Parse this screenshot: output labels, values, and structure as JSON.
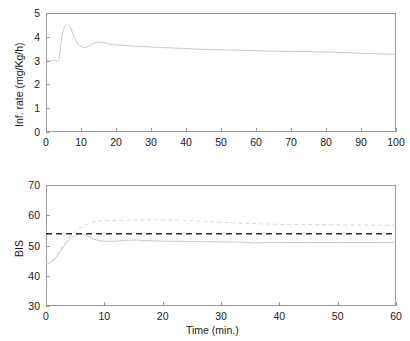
{
  "figure": {
    "background": "#ffffff",
    "axis_color": "#9a9a9a",
    "text_color": "#1a1a1a"
  },
  "chart_data": [
    {
      "type": "line",
      "panel": "top",
      "title": "",
      "xlabel": "",
      "ylabel": "Inf. rate (mg/Kg/h)",
      "xlim": [
        0,
        100
      ],
      "ylim": [
        0,
        5
      ],
      "xticks": [
        0,
        10,
        20,
        30,
        40,
        50,
        60,
        70,
        80,
        90,
        100
      ],
      "yticks": [
        0,
        1,
        2,
        3,
        4,
        5
      ],
      "grid": false,
      "legend": "none",
      "series": [
        {
          "name": "infusion-rate",
          "style": "solid",
          "color": "#c9c9c9",
          "x": [
            0,
            1,
            2,
            3,
            3.6,
            3.9,
            4.2,
            4.6,
            5.0,
            5.4,
            5.8,
            6.2,
            6.6,
            7.0,
            7.4,
            7.8,
            8.2,
            8.6,
            9.0,
            9.5,
            10.0,
            10.5,
            11.0,
            11.5,
            12.0,
            12.5,
            13.0,
            13.5,
            14.0,
            14.5,
            15.0,
            15.5,
            16.0,
            17.0,
            18.0,
            19.0,
            20.0,
            22.0,
            24.0,
            26.0,
            28.0,
            30.0,
            33.0,
            36.0,
            39.0,
            42.0,
            45.0,
            48.0,
            51.0,
            54.0,
            57.0,
            60.0,
            64.0,
            68.0,
            72.0,
            76.0,
            80.0,
            84.0,
            88.0,
            92.0,
            96.0,
            98.0,
            100.0
          ],
          "y": [
            3.0,
            3.0,
            3.0,
            3.0,
            3.0,
            3.25,
            3.62,
            4.02,
            4.28,
            4.42,
            4.49,
            4.5,
            4.47,
            4.38,
            4.24,
            4.08,
            3.94,
            3.82,
            3.72,
            3.64,
            3.59,
            3.56,
            3.55,
            3.56,
            3.59,
            3.63,
            3.68,
            3.72,
            3.75,
            3.77,
            3.78,
            3.77,
            3.76,
            3.73,
            3.7,
            3.68,
            3.66,
            3.64,
            3.62,
            3.6,
            3.59,
            3.57,
            3.55,
            3.53,
            3.51,
            3.49,
            3.47,
            3.46,
            3.45,
            3.44,
            3.43,
            3.42,
            3.4,
            3.39,
            3.38,
            3.37,
            3.36,
            3.34,
            3.32,
            3.3,
            3.28,
            3.27,
            3.26
          ]
        }
      ]
    },
    {
      "type": "line",
      "panel": "bottom",
      "title": "",
      "xlabel": "Time (min.)",
      "ylabel": "BIS",
      "xlim": [
        0,
        60
      ],
      "ylim": [
        30,
        70
      ],
      "xticks": [
        0,
        10,
        20,
        30,
        40,
        50,
        60
      ],
      "yticks": [
        30,
        40,
        50,
        60,
        70
      ],
      "grid": false,
      "legend": "none",
      "series": [
        {
          "name": "bis-measured",
          "style": "solid",
          "color": "#c9c9c9",
          "x": [
            0,
            0.5,
            1.0,
            1.5,
            2.0,
            2.5,
            3.0,
            3.5,
            4.0,
            4.5,
            5.0,
            5.5,
            6.0,
            6.5,
            7.0,
            7.5,
            8.0,
            8.5,
            9.0,
            9.5,
            10.0,
            11.0,
            12.0,
            13.0,
            14.0,
            15.0,
            16.0,
            17.0,
            18.0,
            19.0,
            20.0,
            22.0,
            24.0,
            26.0,
            28.0,
            30.0,
            32.0,
            34.0,
            35.5,
            37.0,
            39.0,
            42.0,
            45.0,
            48.0,
            51.0,
            54.0,
            57.0,
            60.0
          ],
          "y": [
            44.0,
            44.1,
            44.6,
            45.5,
            46.8,
            48.2,
            49.6,
            50.9,
            52.0,
            52.9,
            53.5,
            53.8,
            53.9,
            53.7,
            53.3,
            52.8,
            52.3,
            51.9,
            51.7,
            51.5,
            51.45,
            51.4,
            51.45,
            51.6,
            51.75,
            51.8,
            51.75,
            51.65,
            51.55,
            51.5,
            51.45,
            51.4,
            51.35,
            51.3,
            51.25,
            51.2,
            51.15,
            51.1,
            50.85,
            50.9,
            50.95,
            51.0,
            51.0,
            51.0,
            51.0,
            51.0,
            51.0,
            51.0
          ]
        },
        {
          "name": "bis-estimated",
          "style": "dashed",
          "color": "#d6d6d6",
          "x": [
            0,
            0.5,
            1.0,
            1.5,
            2.0,
            2.5,
            3.0,
            3.5,
            4.0,
            4.5,
            5.0,
            5.5,
            6.0,
            6.5,
            7.0,
            7.5,
            8.0,
            8.5,
            9.0,
            10.0,
            11.0,
            12.0,
            13.0,
            14.0,
            15.0,
            16.0,
            17.0,
            18.0,
            19.0,
            20.0,
            21.0,
            22.0,
            24.0,
            26.0,
            28.0,
            30.0,
            32.0,
            34.0,
            36.0,
            38.0,
            40.0,
            43.0,
            46.0,
            49.0,
            52.0,
            55.0,
            58.0,
            60.0
          ],
          "y": [
            44.0,
            44.2,
            44.9,
            46.0,
            47.4,
            48.9,
            50.3,
            51.6,
            52.8,
            53.8,
            54.6,
            55.4,
            56.0,
            56.6,
            57.0,
            57.4,
            57.7,
            57.9,
            58.0,
            58.15,
            58.2,
            58.25,
            58.3,
            58.35,
            58.4,
            58.45,
            58.5,
            58.5,
            58.5,
            58.5,
            58.5,
            58.45,
            58.3,
            58.1,
            57.9,
            57.7,
            57.5,
            57.35,
            57.2,
            57.1,
            57.0,
            56.95,
            56.9,
            56.85,
            56.8,
            56.75,
            56.7,
            56.6
          ]
        },
        {
          "name": "bis-reference",
          "style": "dashed-black",
          "color": "#2b2b2b",
          "x": [
            0,
            60
          ],
          "y": [
            53.9,
            53.9
          ]
        }
      ]
    }
  ]
}
